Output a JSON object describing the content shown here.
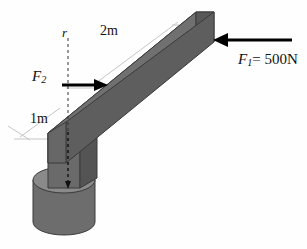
{
  "figure": {
    "background_color": "#fefefe"
  },
  "labels": {
    "dimension_2m": "2m",
    "dimension_1m": "1m",
    "axis_r": "r",
    "force_2_symbol": "F",
    "force_2_subscript": "2",
    "force_1_symbol": "F",
    "force_1_subscript": "1",
    "force_1_value": "= 500N"
  },
  "colors": {
    "beam_top_face": "#8e8e8e",
    "beam_front_face": "#6f6f6f",
    "beam_end_face": "#585858",
    "block_front_face": "#6a6a6a",
    "block_side_face": "#555555",
    "cylinder_top": "#8a8a8a",
    "cylinder_body": "#6d6d6d",
    "outline": "#3a3a3a",
    "arrow": "#000000",
    "dimension_line": "#bdbdbd",
    "centerline": "#1a1a1a"
  },
  "forces": [
    {
      "name": "F1",
      "label": "F1= 500N",
      "magnitude": "500N",
      "direction": "left",
      "applied_at": "free end of beam"
    },
    {
      "name": "F2",
      "label": "F2",
      "magnitude": "",
      "direction": "right",
      "applied_at": "beam at 1m above base"
    }
  ],
  "dimensions": [
    {
      "name": "along-beam-length",
      "value": "2m"
    },
    {
      "name": "vertical-height",
      "value": "1m"
    }
  ]
}
